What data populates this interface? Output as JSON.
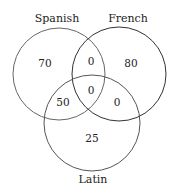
{
  "diagram": {
    "type": "venn",
    "sets": [
      {
        "name": "Spanish",
        "cx": 59,
        "cy": 74,
        "r": 46,
        "stroke": "#555555"
      },
      {
        "name": "French",
        "cx": 119,
        "cy": 74,
        "r": 47,
        "stroke": "#333333"
      },
      {
        "name": "Latin",
        "cx": 92,
        "cy": 123,
        "r": 48,
        "stroke": "#555555"
      }
    ],
    "labels": {
      "spanish": "Spanish",
      "french": "French",
      "latin": "Latin"
    },
    "regions": {
      "spanish_only": "70",
      "french_only": "80",
      "latin_only": "25",
      "spanish_french_only": "0",
      "spanish_latin_only": "50",
      "french_latin_only": "0",
      "all_three": "0"
    }
  }
}
